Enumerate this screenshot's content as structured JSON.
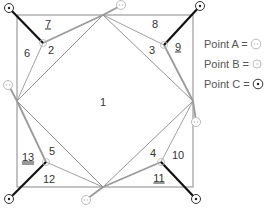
{
  "diagram": {
    "square": {
      "x1": 17,
      "y1": 15,
      "x2": 193,
      "y2": 187
    },
    "colors": {
      "thin_line": "#777777",
      "gray_thick": "#aaaaaa",
      "black_thick": "#111111",
      "point_a": "#bbbbbb",
      "point_b": "#aaaaaa",
      "point_c": "#333333"
    },
    "regions": [
      {
        "id": "1",
        "label": "1",
        "x": 103,
        "y": 102,
        "style": "plain"
      },
      {
        "id": "2",
        "label": "2",
        "x": 51,
        "y": 50,
        "style": "plain"
      },
      {
        "id": "3",
        "label": "3",
        "x": 152,
        "y": 50,
        "style": "plain"
      },
      {
        "id": "4",
        "label": "4",
        "x": 153,
        "y": 153,
        "style": "plain"
      },
      {
        "id": "5",
        "label": "5",
        "x": 52,
        "y": 151,
        "style": "plain"
      },
      {
        "id": "6",
        "label": "6",
        "x": 27,
        "y": 53,
        "style": "plain"
      },
      {
        "id": "7",
        "label": "7",
        "x": 48,
        "y": 24,
        "style": "underline"
      },
      {
        "id": "8",
        "label": "8",
        "x": 155,
        "y": 24,
        "style": "plain"
      },
      {
        "id": "9",
        "label": "9",
        "x": 178,
        "y": 47,
        "style": "underline"
      },
      {
        "id": "10",
        "label": "10",
        "x": 178,
        "y": 155,
        "style": "plain"
      },
      {
        "id": "11",
        "label": "11",
        "x": 159,
        "y": 178,
        "style": "underline"
      },
      {
        "id": "12",
        "label": "12",
        "x": 49,
        "y": 179,
        "style": "plain"
      },
      {
        "id": "13",
        "label": "13",
        "x": 28,
        "y": 157,
        "style": "double-underline"
      }
    ]
  },
  "legend": {
    "items": [
      {
        "label": "Point A =",
        "symbol": "point-a"
      },
      {
        "label": "Point B =",
        "symbol": "point-b"
      },
      {
        "label": "Point C =",
        "symbol": "point-c"
      }
    ]
  }
}
